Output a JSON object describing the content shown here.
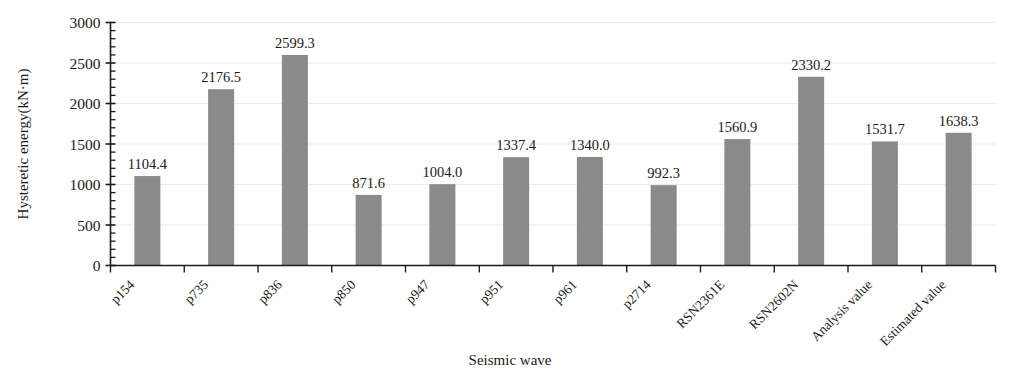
{
  "chart_data": {
    "type": "bar",
    "title": "",
    "xlabel": "Seismic wave",
    "ylabel": "Hysteretic energy(kN·m)",
    "categories": [
      "p154",
      "p735",
      "p836",
      "p850",
      "p947",
      "p951",
      "p961",
      "p2714",
      "RSN2361E",
      "RSN2602N",
      "Analysis value",
      "Estimated value"
    ],
    "values": [
      1104.4,
      2176.5,
      2599.3,
      871.6,
      1004.0,
      1337.4,
      1340.0,
      992.3,
      1560.9,
      2330.2,
      1531.7,
      1638.3
    ],
    "value_labels": [
      "1104.4",
      "2176.5",
      "2599.3",
      "871.6",
      "1004.0",
      "1337.4",
      "1340.0",
      "992.3",
      "1560.9",
      "2330.2",
      "1531.7",
      "1638.3"
    ],
    "ylim": [
      0,
      3000
    ],
    "ytick_values": [
      0,
      500,
      1000,
      1500,
      2000,
      2500,
      3000
    ],
    "ytick_labels": [
      "0",
      "500",
      "1000",
      "1500",
      "2000",
      "2500",
      "3000"
    ],
    "yminor_step": 100,
    "grid": true,
    "grid_axis": "y",
    "legend": "none",
    "bar_color": "#8a8a8a",
    "grid_color": "#eceaea",
    "axis_color": "#1b1b1b",
    "category_label_rotation": -45
  }
}
